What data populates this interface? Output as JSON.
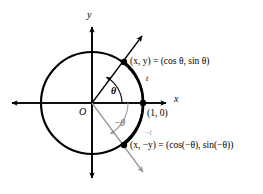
{
  "figure": {
    "axes": {
      "x_label": "x",
      "y_label": "y",
      "origin_label": "O"
    },
    "colors": {
      "stroke_primary": "#000000",
      "stroke_secondary": "#9a9a9a",
      "background": "#ffffff"
    },
    "circle": {
      "center_x": 92,
      "center_y": 103,
      "radius": 51
    },
    "points": [
      {
        "name": "point-upper",
        "label": "(x, y) = (cos θ, sin θ)",
        "x": 124,
        "y": 62
      },
      {
        "name": "point-unit",
        "label": "(1, 0)",
        "x": 143,
        "y": 103
      },
      {
        "name": "point-lower",
        "label": "(x, −y) = (cos(−θ), sin(−θ))",
        "x": 124,
        "y": 145
      }
    ],
    "angles": [
      {
        "name": "angle-theta",
        "label": "θ",
        "direction": "counterclockwise",
        "color": "#000000"
      },
      {
        "name": "angle-negative-theta",
        "label": "−θ",
        "direction": "clockwise",
        "color": "#8a8a8a"
      }
    ],
    "arcs": [
      {
        "name": "arc-t",
        "label": "t",
        "color": "#000000"
      },
      {
        "name": "arc-negative-t",
        "label": "−t",
        "color": "#9a9a9a"
      }
    ]
  }
}
